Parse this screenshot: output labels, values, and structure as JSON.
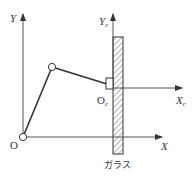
{
  "diagram": {
    "title": "",
    "world_frame": {
      "x_label": "X",
      "y_label": "Y",
      "origin_label": "O"
    },
    "glass_frame": {
      "x_label": "X",
      "x_sub": "c",
      "y_label": "Y",
      "y_sub": "c",
      "origin_label": "O",
      "origin_sub": "c"
    },
    "glass_label": "ガラス",
    "colors": {
      "line": "#333333",
      "axis": "#555555",
      "hatch": "#444444",
      "background": "#ffffff"
    },
    "elements": [
      {
        "name": "robot-base-joint",
        "type": "circle"
      },
      {
        "name": "robot-elbow-joint",
        "type": "circle"
      },
      {
        "name": "link-1",
        "type": "line"
      },
      {
        "name": "link-2",
        "type": "line"
      },
      {
        "name": "end-effector",
        "type": "rect"
      },
      {
        "name": "glass-pane",
        "type": "hatched-rect"
      }
    ]
  }
}
